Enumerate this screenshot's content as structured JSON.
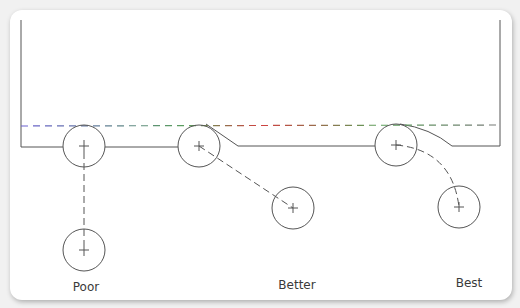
{
  "diagram": {
    "labels": {
      "poor": "Poor",
      "better": "Better",
      "best": "Best"
    },
    "colors": {
      "line": "#555555",
      "dash_gradient": [
        "#6a5fd0",
        "#5aa05a",
        "#d04040",
        "#5aa05a",
        "#777777"
      ],
      "top_edge_gradient": [
        "#555555",
        "#9a8fe0",
        "#c8e070"
      ],
      "card_background": "#ffffff",
      "page_background": "#f1f1f1"
    },
    "examples": [
      {
        "name": "Poor",
        "circle_start": [
          84,
          146
        ],
        "circle_end": [
          84,
          250
        ],
        "path": "straight-vertical"
      },
      {
        "name": "Better",
        "circle_start": [
          199,
          146
        ],
        "circle_end": [
          293,
          208
        ],
        "path": "straight-diagonal"
      },
      {
        "name": "Best",
        "circle_start": [
          396,
          145
        ],
        "circle_end": [
          459,
          207
        ],
        "path": "curved-arc"
      }
    ]
  }
}
